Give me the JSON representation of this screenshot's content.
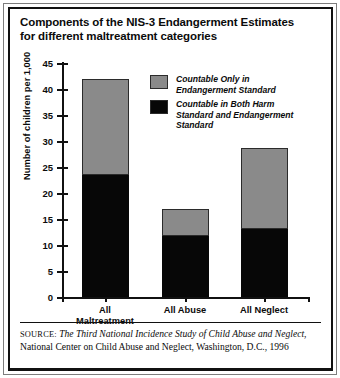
{
  "title": "Components of the NIS-3 Endangerment Estimates for different maltreatment categories",
  "legend": {
    "items": [
      {
        "label": "Countable Only in Endangerment Standard",
        "color": "#8a8a8a",
        "swatch_name": "legend-swatch-endangerment-only"
      },
      {
        "label": "Countable in Both Harm Standard and Endangerment Standard",
        "color": "#070707",
        "swatch_name": "legend-swatch-both-harm-and-endangerment"
      }
    ]
  },
  "source": {
    "prefix": "SOURCE:",
    "italic_part": "The Third National Incidence Study of Child Abuse and Neglect",
    "rest": ", National Center on Child Abuse and Neglect, Washington, D.C., 1996"
  },
  "chart_data": {
    "type": "bar",
    "stacked": true,
    "title": "Components of the NIS-3 Endangerment Estimates for different maltreatment categories",
    "xlabel": "",
    "ylabel": "Number of children per 1,000",
    "ylim": [
      0,
      45
    ],
    "ytick_step": 5,
    "yticks": [
      0,
      5,
      10,
      15,
      20,
      25,
      30,
      35,
      40,
      45
    ],
    "ytick_labels": [
      "0",
      "5",
      "10",
      "15",
      "20",
      "25",
      "30",
      "35",
      "40",
      "45"
    ],
    "grid": false,
    "legend_position": "upper-right-inside",
    "categories": [
      "All Maltreatment",
      "All Abuse",
      "All Neglect"
    ],
    "category_label_lines": [
      [
        "All",
        "Maltreatment"
      ],
      [
        "All Abuse"
      ],
      [
        "All Neglect"
      ]
    ],
    "series": [
      {
        "name": "Countable in Both Harm Standard and Endangerment Standard",
        "color": "#070707",
        "values": [
          23.5,
          11.8,
          13.1
        ]
      },
      {
        "name": "Countable Only in Endangerment Standard",
        "color": "#8a8a8a",
        "values": [
          18.5,
          5.2,
          15.5
        ]
      }
    ],
    "totals": [
      42.0,
      17.0,
      28.6
    ]
  }
}
